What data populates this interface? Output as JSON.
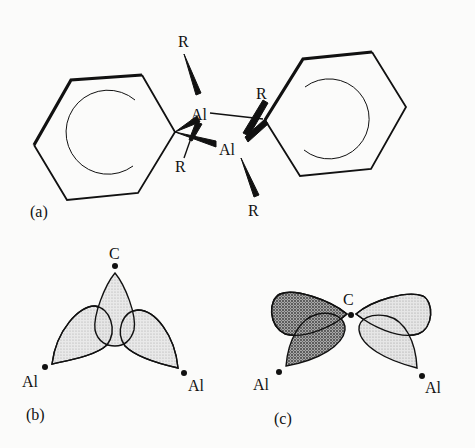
{
  "panels": {
    "a": {
      "label": "(a)",
      "atoms": {
        "al_top": "Al",
        "al_bottom": "Al",
        "r_top": "R",
        "r_bridge_left": "R",
        "r_bridge_right": "R",
        "r_bottom": "R"
      },
      "description": "Dimeric diphenyl-bridged organoaluminium: two phenyl rings bridging two Al atoms, each Al bearing terminal R groups"
    },
    "b": {
      "label": "(b)",
      "atoms": {
        "c": "C",
        "al_left": "Al",
        "al_right": "Al"
      },
      "description": "Three sp2-type lobes overlapping (bonding combination)"
    },
    "c": {
      "label": "(c)",
      "atoms": {
        "c": "C",
        "al_left": "Al",
        "al_right": "Al"
      },
      "description": "p-orbital with opposite-phase lobes overlapping Al orbitals"
    }
  },
  "colors": {
    "ink": "#111111",
    "light_fill": "#d9d9d9",
    "dark_fill": "#8a8a8a",
    "background": "#fbfbfa"
  }
}
